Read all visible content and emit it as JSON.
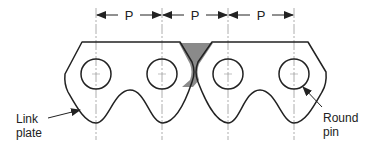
{
  "diagram": {
    "type": "roller chain / silent chain link schematic",
    "pitch": {
      "label": "P",
      "count": 3,
      "labels": [
        "P",
        "P",
        "P"
      ]
    },
    "callouts": {
      "link_plate": {
        "line1": "Link",
        "line2": "plate"
      },
      "round_pin": {
        "line1": "Round",
        "line2": "pin"
      }
    },
    "colors": {
      "stroke": "#222222",
      "centerline": "#999999",
      "shaded_gap": "#8a8a8a",
      "background": "#ffffff"
    }
  }
}
